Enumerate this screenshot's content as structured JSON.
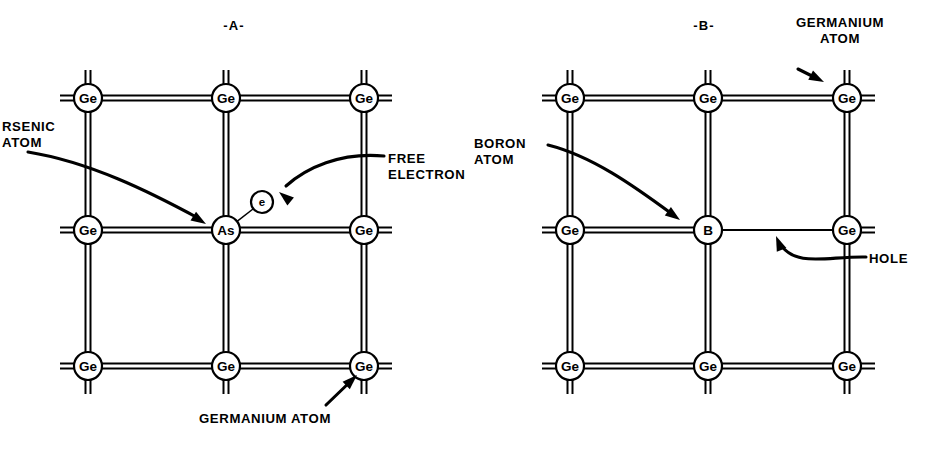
{
  "figure": {
    "background_color": "#ffffff",
    "ink_color": "#000000"
  },
  "panels": [
    {
      "id": "panel-a",
      "title": "-A-",
      "title_pos": {
        "x": 234,
        "y": 30
      },
      "grid": {
        "cols_x": [
          88,
          226,
          364
        ],
        "rows_y": [
          98,
          230,
          366
        ],
        "stub": 28,
        "node_radius": 14,
        "bond_gap": 5
      },
      "nodes": [
        {
          "label": "Ge",
          "col": 0,
          "row": 0,
          "kind": "germanium"
        },
        {
          "label": "Ge",
          "col": 1,
          "row": 0,
          "kind": "germanium"
        },
        {
          "label": "Ge",
          "col": 2,
          "row": 0,
          "kind": "germanium"
        },
        {
          "label": "Ge",
          "col": 0,
          "row": 1,
          "kind": "germanium"
        },
        {
          "label": "As",
          "col": 1,
          "row": 1,
          "kind": "arsenic"
        },
        {
          "label": "Ge",
          "col": 2,
          "row": 1,
          "kind": "germanium"
        },
        {
          "label": "Ge",
          "col": 0,
          "row": 2,
          "kind": "germanium"
        },
        {
          "label": "Ge",
          "col": 1,
          "row": 2,
          "kind": "germanium"
        },
        {
          "label": "Ge",
          "col": 2,
          "row": 2,
          "kind": "germanium"
        }
      ],
      "free_electron": {
        "label": "e",
        "x": 262,
        "y": 202,
        "radius": 11
      },
      "callouts": [
        {
          "name": "arsenic-atom",
          "lines": [
            "RSENIC",
            "ATOM"
          ],
          "full_text": "ARSENIC ATOM",
          "clipped_left": true,
          "text_x": 2,
          "text_y": 131,
          "align": "start",
          "arrow_path": "M 28,152 C 90,162 150,192 198,218",
          "arrow_tip": {
            "x": 206,
            "y": 224,
            "angle": 32
          }
        },
        {
          "name": "free-electron",
          "lines": [
            "FREE",
            "ELECTRON"
          ],
          "full_text": "FREE ELECTRON",
          "clipped_left": false,
          "text_x": 388,
          "text_y": 163,
          "align": "start",
          "arrow_path": "M 384,156 C 340,152 306,168 286,186",
          "arrow_tip": {
            "x": 279,
            "y": 192,
            "angle": 219
          }
        },
        {
          "name": "germanium-atom",
          "lines": [
            "GERMANIUM ATOM"
          ],
          "full_text": "GERMANIUM ATOM",
          "clipped_left": false,
          "text_x": 265,
          "text_y": 423,
          "align": "middle",
          "arrow_path": "M 326,405 L 352,380",
          "arrow_tip": {
            "x": 357,
            "y": 375,
            "angle": -44
          }
        }
      ]
    },
    {
      "id": "panel-b",
      "title": "-B-",
      "title_pos": {
        "x": 704,
        "y": 30
      },
      "grid": {
        "cols_x": [
          570,
          708,
          847
        ],
        "rows_y": [
          98,
          230,
          366
        ],
        "stub": 28,
        "node_radius": 14,
        "bond_gap": 5
      },
      "nodes": [
        {
          "label": "Ge",
          "col": 0,
          "row": 0,
          "kind": "germanium"
        },
        {
          "label": "Ge",
          "col": 1,
          "row": 0,
          "kind": "germanium"
        },
        {
          "label": "Ge",
          "col": 2,
          "row": 0,
          "kind": "germanium"
        },
        {
          "label": "Ge",
          "col": 0,
          "row": 1,
          "kind": "germanium"
        },
        {
          "label": "B",
          "col": 1,
          "row": 1,
          "kind": "boron"
        },
        {
          "label": "Ge",
          "col": 2,
          "row": 1,
          "kind": "germanium"
        },
        {
          "label": "Ge",
          "col": 0,
          "row": 2,
          "kind": "germanium"
        },
        {
          "label": "Ge",
          "col": 1,
          "row": 2,
          "kind": "germanium"
        },
        {
          "label": "Ge",
          "col": 2,
          "row": 2,
          "kind": "germanium"
        }
      ],
      "hole_bond": {
        "description": "single-line bond between B (col 1, row 1) and Ge (col 2, row 1) representing a missing electron",
        "from": {
          "col": 1,
          "row": 1
        },
        "to": {
          "col": 2,
          "row": 1
        }
      },
      "callouts": [
        {
          "name": "germanium-atom",
          "lines": [
            "GERMANIUM",
            "ATOM"
          ],
          "full_text": "GERMANIUM ATOM",
          "clipped_left": false,
          "text_x": 840,
          "text_y": 27,
          "align": "middle",
          "arrow_path": "M 798,69 L 818,79",
          "arrow_tip": {
            "x": 824,
            "y": 82,
            "angle": 27
          }
        },
        {
          "name": "boron-atom",
          "lines": [
            "BORON",
            "ATOM"
          ],
          "full_text": "BORON ATOM",
          "clipped_left": false,
          "text_x": 474,
          "text_y": 148,
          "align": "start",
          "arrow_path": "M 548,145 C 592,156 634,186 672,214",
          "arrow_tip": {
            "x": 680,
            "y": 220,
            "angle": 36
          }
        },
        {
          "name": "hole",
          "lines": [
            "HOLE"
          ],
          "full_text": "HOLE",
          "clipped_left": false,
          "text_x": 869,
          "text_y": 263,
          "align": "start",
          "arrow_path": "M 866,257 C 828,256 796,268 780,244",
          "arrow_tip": {
            "x": 776,
            "y": 236,
            "angle": 248
          }
        }
      ]
    }
  ]
}
